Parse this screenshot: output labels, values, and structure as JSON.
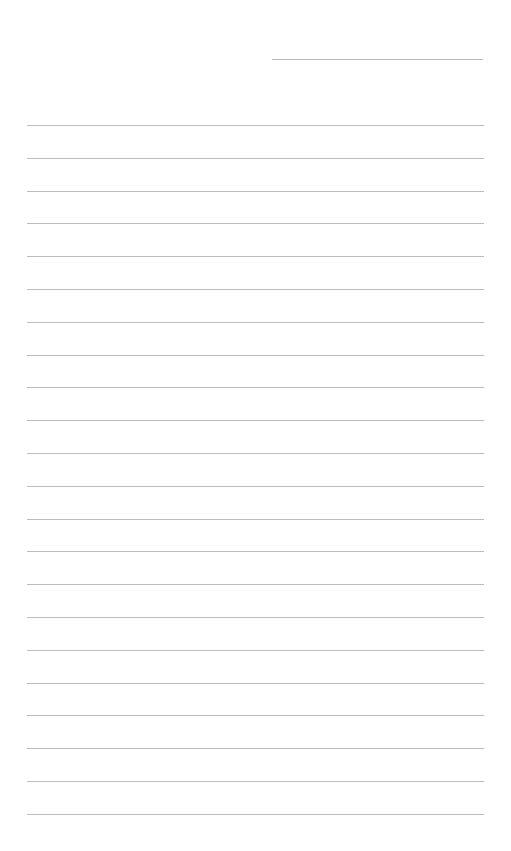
{
  "document": {
    "type": "lined-paper",
    "header_field_count": 1,
    "ruled_line_count": 22,
    "line_color": "#bcbcbc",
    "background_color": "#ffffff"
  }
}
